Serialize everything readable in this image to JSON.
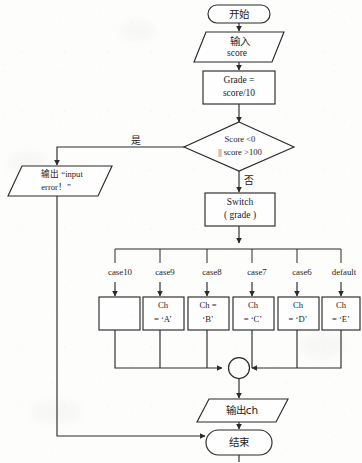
{
  "diagram": {
    "nodes": {
      "start": {
        "label": "开始",
        "shape": "terminator"
      },
      "input_score": {
        "label_line1": "输入",
        "label_line2": "score",
        "shape": "parallelogram"
      },
      "grade_calc": {
        "label_line1": "Grade =",
        "label_line2": "score/10",
        "shape": "process"
      },
      "range_check": {
        "label_line1": "Score <0",
        "label_line2": "|| score >100",
        "shape": "decision"
      },
      "error_output": {
        "label_line1": "输出 “input",
        "label_line2": "error！”",
        "shape": "parallelogram"
      },
      "switch_grade": {
        "label_line1": "Switch",
        "label_line2": "( grade )",
        "shape": "process"
      },
      "merge": {
        "label": "",
        "shape": "connector-circle"
      },
      "output_ch": {
        "label": "输出ch",
        "shape": "parallelogram"
      },
      "end": {
        "label": "结束",
        "shape": "terminator"
      }
    },
    "branch_labels": {
      "yes": "是",
      "no": "否"
    },
    "cases": [
      {
        "case_label": "case10",
        "body_line1": "",
        "body_line2": ""
      },
      {
        "case_label": "case9",
        "body_line1": "Ch",
        "body_line2": "= ‘A’"
      },
      {
        "case_label": "case8",
        "body_line1": "Ch =",
        "body_line2": "‘B’"
      },
      {
        "case_label": "case7",
        "body_line1": "Ch",
        "body_line2": "= ‘C’"
      },
      {
        "case_label": "case6",
        "body_line1": "Ch",
        "body_line2": "= ‘D’"
      },
      {
        "case_label": "default",
        "body_line1": "Ch",
        "body_line2": "= ‘E’"
      }
    ],
    "colors": {
      "stroke": "#2b2b2b",
      "fill": "#fefefe",
      "background": "#fdfdfc",
      "text": "#1c1c1c"
    }
  }
}
